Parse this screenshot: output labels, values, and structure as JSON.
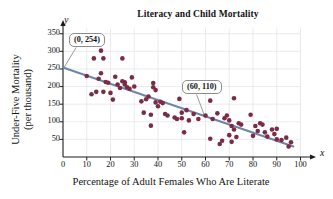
{
  "chart_data": {
    "type": "scatter",
    "title": "Literacy and Child Mortality",
    "xlabel": "Percentage of Adult Females Who Are Literate",
    "ylabel_line1": "Under-Five Mortality",
    "ylabel_line2": "(per thousand)",
    "x_axis_letter": "x",
    "y_axis_letter": "y",
    "xlim": [
      0,
      104
    ],
    "ylim": [
      0,
      372
    ],
    "xticks": [
      0,
      10,
      20,
      30,
      40,
      50,
      60,
      70,
      80,
      90,
      100
    ],
    "yticks": [
      50,
      100,
      150,
      200,
      250,
      300,
      350
    ],
    "grid": true,
    "legend": "none",
    "point_color": "#7c2b45",
    "line_color": "#6d85a8",
    "grid_color": "#e2e2e6",
    "axis_color": "#1c1c1c",
    "trend_line": {
      "label": "least-squares regression line",
      "x": [
        0,
        97
      ],
      "y": [
        254,
        30
      ],
      "slope": -2.31,
      "intercept": 254
    },
    "annotations": [
      {
        "name": "y-intercept-callout",
        "text": "(0, 254)",
        "target_x": 0,
        "target_y": 254
      },
      {
        "name": "point-callout",
        "text": "(60, 110)",
        "target_x": 60,
        "target_y": 110
      }
    ],
    "points": [
      [
        10,
        230
      ],
      [
        12,
        178
      ],
      [
        13,
        280
      ],
      [
        14,
        185
      ],
      [
        15,
        222
      ],
      [
        16,
        302
      ],
      [
        16,
        238
      ],
      [
        17,
        185
      ],
      [
        17,
        280
      ],
      [
        18,
        213
      ],
      [
        19,
        211
      ],
      [
        20,
        182
      ],
      [
        21,
        163
      ],
      [
        22,
        228
      ],
      [
        23,
        206
      ],
      [
        24,
        196
      ],
      [
        25,
        215
      ],
      [
        25,
        280
      ],
      [
        26,
        212
      ],
      [
        26,
        206
      ],
      [
        27,
        198
      ],
      [
        28,
        194
      ],
      [
        29,
        226
      ],
      [
        30,
        200
      ],
      [
        33,
        158
      ],
      [
        34,
        126
      ],
      [
        35,
        164
      ],
      [
        36,
        172
      ],
      [
        37,
        120
      ],
      [
        37,
        89
      ],
      [
        38,
        210
      ],
      [
        38,
        198
      ],
      [
        39,
        155
      ],
      [
        39,
        190
      ],
      [
        40,
        144
      ],
      [
        41,
        157
      ],
      [
        42,
        153
      ],
      [
        43,
        122
      ],
      [
        44,
        118
      ],
      [
        47,
        112
      ],
      [
        48,
        108
      ],
      [
        49,
        165
      ],
      [
        50,
        126
      ],
      [
        50,
        110
      ],
      [
        51,
        70
      ],
      [
        52,
        133
      ],
      [
        53,
        104
      ],
      [
        55,
        122
      ],
      [
        57,
        108
      ],
      [
        60,
        118
      ],
      [
        62,
        160
      ],
      [
        62,
        52
      ],
      [
        63,
        108
      ],
      [
        65,
        124
      ],
      [
        66,
        37
      ],
      [
        67,
        46
      ],
      [
        68,
        110
      ],
      [
        69,
        118
      ],
      [
        70,
        104
      ],
      [
        70,
        62
      ],
      [
        71,
        43
      ],
      [
        71,
        88
      ],
      [
        72,
        167
      ],
      [
        72,
        78
      ],
      [
        73,
        57
      ],
      [
        74,
        96
      ],
      [
        75,
        92
      ],
      [
        79,
        120
      ],
      [
        80,
        60
      ],
      [
        81,
        88
      ],
      [
        82,
        74
      ],
      [
        83,
        96
      ],
      [
        84,
        92
      ],
      [
        85,
        70
      ],
      [
        86,
        58
      ],
      [
        88,
        78
      ],
      [
        89,
        65
      ],
      [
        90,
        80
      ],
      [
        90,
        50
      ],
      [
        92,
        48
      ],
      [
        94,
        55
      ],
      [
        95,
        30
      ],
      [
        96,
        42
      ]
    ]
  }
}
